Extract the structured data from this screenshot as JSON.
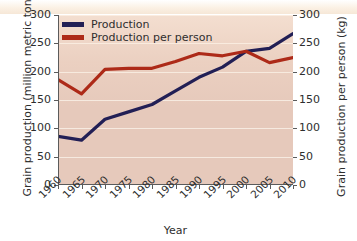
{
  "chart_data": {
    "type": "line",
    "title": "",
    "xlabel": "Year",
    "ylabel": "Grain production (million metric tons)",
    "y2label": "Grain production per person (kg)",
    "x": [
      1960,
      1965,
      1970,
      1975,
      1980,
      1985,
      1990,
      1995,
      2000,
      2005,
      2010
    ],
    "xtick_labels": [
      "1960",
      "1965",
      "1970",
      "1975",
      "1980",
      "1985",
      "1990",
      "1995",
      "2000",
      "2005",
      "2010"
    ],
    "ylim": [
      0,
      300
    ],
    "y2lim": [
      0,
      300
    ],
    "ytick_labels": [
      "0",
      "50",
      "100",
      "150",
      "200",
      "250",
      "300"
    ],
    "ytick_values": [
      0,
      50,
      100,
      150,
      200,
      250,
      300
    ],
    "y2tick_labels": [
      "0",
      "50",
      "100",
      "150",
      "200",
      "250",
      "300"
    ],
    "y2tick_values": [
      0,
      50,
      100,
      150,
      200,
      250,
      300
    ],
    "grid": "horizontal",
    "legend_position": "top-left",
    "series": [
      {
        "name": "Production",
        "axis": "left",
        "unit": "million metric tons",
        "color": "#221f55",
        "values": [
          86,
          79,
          116,
          129,
          142,
          166,
          190,
          208,
          236,
          241,
          267
        ]
      },
      {
        "name": "Production per person",
        "axis": "right",
        "unit": "kg",
        "color": "#ad2a18",
        "values": [
          186,
          161,
          204,
          206,
          206,
          218,
          232,
          228,
          236,
          216,
          225
        ]
      }
    ]
  },
  "legend": {
    "items": [
      {
        "label": "Production",
        "color": "#221f55"
      },
      {
        "label": "Production per person",
        "color": "#ad2a18"
      }
    ]
  },
  "colors": {
    "plot_background": "#e6c9bb",
    "gridline": "#f7ece2",
    "axis": "#5b5b5b",
    "text": "#2e2e2e",
    "figure_background": "#ffffff",
    "top_band": "#f6e7d7"
  }
}
